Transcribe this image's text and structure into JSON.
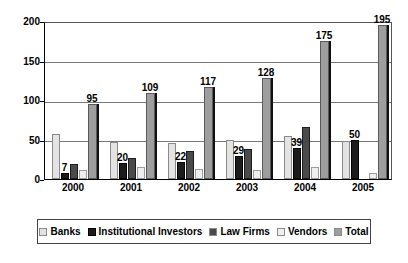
{
  "chart_data": {
    "type": "bar",
    "title": "",
    "subtitle": "",
    "xlabel": "",
    "ylabel": "",
    "categories": [
      "2000",
      "2001",
      "2002",
      "2003",
      "2004",
      "2005"
    ],
    "ylim": [
      0,
      200
    ],
    "yticks": [
      0,
      50,
      100,
      150,
      200
    ],
    "ytick_labels": [
      "0",
      "50",
      "100",
      "150",
      "200"
    ],
    "grid": true,
    "grid_axis": "y",
    "legend_position": "bottom",
    "series": [
      {
        "name": "Banks",
        "color": "#e3e3e3",
        "values": [
          57,
          47,
          46,
          49,
          55,
          48
        ],
        "labels": [
          "",
          "",
          "",
          "",
          "",
          ""
        ]
      },
      {
        "name": "Institutional Investors",
        "color": "#1b1b1b",
        "values": [
          7,
          20,
          22,
          29,
          39,
          50
        ],
        "labels": [
          "7",
          "20",
          "22",
          "29",
          "39",
          "50"
        ]
      },
      {
        "name": "Law Firms",
        "color": "#4a4a4a",
        "values": [
          19,
          27,
          36,
          38,
          66,
          0
        ],
        "labels": [
          "",
          "",
          "",
          "",
          "",
          ""
        ]
      },
      {
        "name": "Vendors",
        "color": "#efefef",
        "values": [
          12,
          15,
          13,
          12,
          15,
          8
        ],
        "labels": [
          "",
          "",
          "",
          "",
          "",
          ""
        ]
      },
      {
        "name": "Total",
        "color": "#9e9e9e",
        "values": [
          95,
          109,
          117,
          128,
          175,
          195
        ],
        "labels": [
          "95",
          "109",
          "117",
          "128",
          "175",
          "195"
        ]
      }
    ]
  },
  "legend": {
    "items": [
      {
        "label": "Banks"
      },
      {
        "label": "Institutional Investors"
      },
      {
        "label": "Law Firms"
      },
      {
        "label": "Vendors"
      },
      {
        "label": "Total"
      }
    ]
  }
}
